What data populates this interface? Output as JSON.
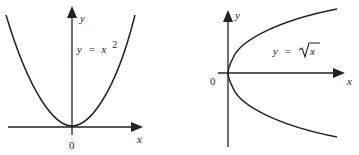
{
  "figures": [
    {
      "id": "left",
      "equation": {
        "lhs": "y",
        "eq": "=",
        "rhs": "x",
        "exponent": "2"
      },
      "axis_labels": {
        "x": "x",
        "y": "y"
      },
      "origin_label": "0",
      "curve": "parabola opening upward, vertex at origin"
    },
    {
      "id": "right",
      "equation": {
        "lhs": "y",
        "eq": "=",
        "rhs": "x",
        "radical": "√"
      },
      "axis_labels": {
        "x": "x",
        "y": "y"
      },
      "origin_label": "0",
      "curve": "sideways parabola opening right, vertex at origin (y = ±√x)"
    }
  ],
  "colors": {
    "line": "#222222",
    "background": "#ffffff"
  }
}
